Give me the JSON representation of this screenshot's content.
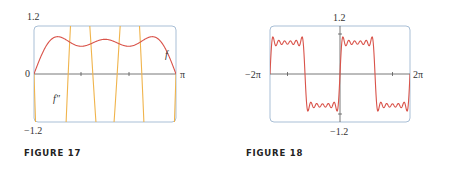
{
  "chart_data": [
    {
      "type": "line",
      "caption": "FIGURE 17",
      "xlim": [
        0,
        3.14159
      ],
      "ylim": [
        -1.2,
        1.2
      ],
      "x_tick_labels": [
        "0",
        "π"
      ],
      "y_tick_labels": [
        "1.2",
        "−1.2"
      ],
      "frame_color": "#a9bfd6",
      "axis_color": "#555555",
      "series": [
        {
          "name": "f",
          "label": "f",
          "color": "#d9534a",
          "description": "partial Fourier sum f(x)=sin x + sin 3x/3 + sin 5x/5",
          "coefficients": [
            [
              1,
              1
            ],
            [
              3,
              0.3333
            ],
            [
              5,
              0.2
            ]
          ]
        },
        {
          "name": "f''",
          "label": "f″",
          "color": "#f0b44c",
          "description": "second derivative f''(x)=-(sin x + 3 sin 3x + 5 sin 5x)",
          "coefficients": [
            [
              1,
              -1
            ],
            [
              3,
              -3
            ],
            [
              5,
              -5
            ]
          ]
        }
      ]
    },
    {
      "type": "line",
      "caption": "FIGURE 18",
      "xlim": [
        -6.28318,
        6.28318
      ],
      "ylim": [
        -1.2,
        1.2
      ],
      "x_tick_labels": [
        "−2π",
        "2π"
      ],
      "y_tick_labels": [
        "1.2",
        "−1.2"
      ],
      "frame_color": "#a9bfd6",
      "axis_color": "#555555",
      "series": [
        {
          "name": "f",
          "color": "#d9534a",
          "description": "partial Fourier sum of square wave (odd harmonics up to 11)",
          "coefficients": [
            [
              1,
              1
            ],
            [
              3,
              0.3333
            ],
            [
              5,
              0.2
            ],
            [
              7,
              0.142857
            ],
            [
              9,
              0.111111
            ],
            [
              11,
              0.090909
            ]
          ]
        }
      ]
    }
  ]
}
